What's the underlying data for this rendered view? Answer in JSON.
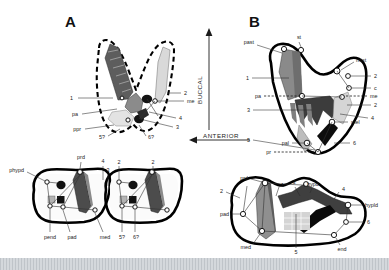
{
  "figure": {
    "panels": [
      {
        "id": "A",
        "letter": "A"
      },
      {
        "id": "B",
        "letter": "B"
      }
    ],
    "direction_labels": [
      {
        "name": "buccal",
        "text": "BUCCAL",
        "arrow": "up"
      },
      {
        "name": "anterior",
        "text": "ANTERIOR",
        "arrow": "left"
      }
    ]
  },
  "panel_a_upper": {
    "labels": [
      {
        "id": "a-u-1",
        "text": "1"
      },
      {
        "id": "a-u-pa",
        "text": "pa"
      },
      {
        "id": "a-u-ppr",
        "text": "ppr"
      },
      {
        "id": "a-u-5q",
        "text": "5?"
      },
      {
        "id": "a-u-2",
        "text": "2"
      },
      {
        "id": "a-u-me",
        "text": "me"
      },
      {
        "id": "a-u-4",
        "text": "4"
      },
      {
        "id": "a-u-3",
        "text": "3"
      },
      {
        "id": "a-u-6q",
        "text": "6?"
      }
    ]
  },
  "panel_a_lower": {
    "labels": [
      {
        "id": "a-l-phypd",
        "text": "phypd"
      },
      {
        "id": "a-l-prd",
        "text": "prd"
      },
      {
        "id": "a-l-pend",
        "text": "pend"
      },
      {
        "id": "a-l-pad",
        "text": "pad"
      },
      {
        "id": "a-l-med",
        "text": "med"
      },
      {
        "id": "a-l-5q",
        "text": "5?"
      },
      {
        "id": "a-l-6q",
        "text": "6?"
      },
      {
        "id": "a-l-2a",
        "text": "2"
      },
      {
        "id": "a-l-3",
        "text": "3"
      },
      {
        "id": "a-l-4",
        "text": "4"
      },
      {
        "id": "a-l-2b",
        "text": "2"
      }
    ]
  },
  "panel_b_upper": {
    "labels": [
      {
        "id": "b-u-past",
        "text": "past"
      },
      {
        "id": "b-u-st",
        "text": "st"
      },
      {
        "id": "b-u-mtst",
        "text": "mtst"
      },
      {
        "id": "b-u-1",
        "text": "1"
      },
      {
        "id": "b-u-2a",
        "text": "2"
      },
      {
        "id": "b-u-c",
        "text": "c"
      },
      {
        "id": "b-u-pa",
        "text": "pa"
      },
      {
        "id": "b-u-me",
        "text": "me"
      },
      {
        "id": "b-u-2b",
        "text": "2"
      },
      {
        "id": "b-u-3",
        "text": "3"
      },
      {
        "id": "b-u-4",
        "text": "4"
      },
      {
        "id": "b-u-pal",
        "text": "pal"
      },
      {
        "id": "b-u-mel",
        "text": "mel"
      },
      {
        "id": "b-u-5",
        "text": "5"
      },
      {
        "id": "b-u-pr",
        "text": "pr"
      },
      {
        "id": "b-u-6",
        "text": "6"
      }
    ]
  },
  "panel_b_lower": {
    "labels": [
      {
        "id": "b-l-prd",
        "text": "prd"
      },
      {
        "id": "b-l-2",
        "text": "2"
      },
      {
        "id": "b-l-1",
        "text": "1"
      },
      {
        "id": "b-l-3",
        "text": "3"
      },
      {
        "id": "b-l-hypd",
        "text": "hypd"
      },
      {
        "id": "b-l-4",
        "text": "4"
      },
      {
        "id": "b-l-hypld",
        "text": "hypld"
      },
      {
        "id": "b-l-pad",
        "text": "pad"
      },
      {
        "id": "b-l-med",
        "text": "med"
      },
      {
        "id": "b-l-5",
        "text": "5"
      },
      {
        "id": "b-l-6",
        "text": "6"
      },
      {
        "id": "b-l-end",
        "text": "end"
      }
    ]
  },
  "colors": {
    "outline": "#000000",
    "shade_dark": "#4a4a4a",
    "shade_mid": "#8d8d8d",
    "shade_light": "#cfcfcf",
    "shade_pale": "#e6e6e6",
    "background": "#ffffff",
    "footer": "#c9cdd2"
  }
}
